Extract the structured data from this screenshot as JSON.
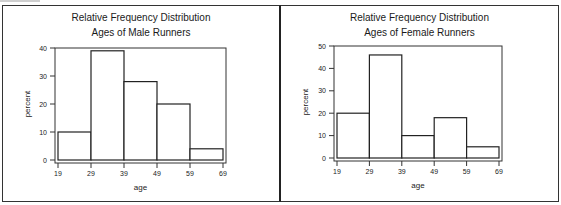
{
  "chart_data": [
    {
      "type": "bar",
      "title": "Relative Frequency Distribution",
      "subtitle": "Ages of Male Runners",
      "xlabel": "age",
      "ylabel": "percent",
      "bin_edges": [
        19,
        29,
        39,
        49,
        59,
        69
      ],
      "categories": [
        "19-29",
        "29-39",
        "39-49",
        "49-59",
        "59-69"
      ],
      "values": [
        10,
        39,
        28,
        20,
        4
      ],
      "ylim": [
        0,
        40
      ],
      "yticks": [
        0,
        10,
        20,
        30,
        40
      ],
      "xticks": [
        19,
        29,
        39,
        49,
        59,
        69
      ],
      "grid": false,
      "legend": null
    },
    {
      "type": "bar",
      "title": "Relative Frequency Distribution",
      "subtitle": "Ages of Female Runners",
      "xlabel": "age",
      "ylabel": "percent",
      "bin_edges": [
        19,
        29,
        39,
        49,
        59,
        69
      ],
      "categories": [
        "19-29",
        "29-39",
        "39-49",
        "49-59",
        "59-69"
      ],
      "values": [
        20,
        46,
        10,
        18,
        5
      ],
      "ylim": [
        0,
        50
      ],
      "yticks": [
        0,
        10,
        20,
        30,
        40,
        50
      ],
      "xticks": [
        19,
        29,
        39,
        49,
        59,
        69
      ],
      "grid": false,
      "legend": null
    }
  ],
  "panels": {
    "left": {
      "title": "Relative Frequency Distribution",
      "subtitle": "Ages of Male Runners",
      "xlabel": "age",
      "ylabel": "percent"
    },
    "right": {
      "title": "Relative Frequency Distribution",
      "subtitle": "Ages of Female Runners",
      "xlabel": "age",
      "ylabel": "percent"
    }
  }
}
